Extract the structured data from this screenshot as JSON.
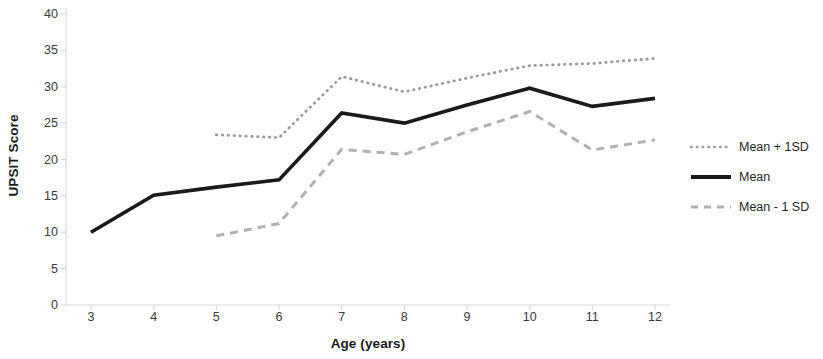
{
  "chart": {
    "type": "line",
    "ylabel": "UPSIT Score",
    "xlabel": "Age (years)"
  },
  "chart_data": {
    "type": "line",
    "title": "",
    "subtitle": "",
    "xlabel": "Age (years)",
    "ylabel": "UPSIT Score",
    "x": [
      3,
      4,
      5,
      6,
      7,
      8,
      9,
      10,
      11,
      12
    ],
    "xtick_labels": [
      "3",
      "4",
      "5",
      "6",
      "7",
      "8",
      "9",
      "10",
      "11",
      "12"
    ],
    "ytick_labels": [
      "0",
      "5",
      "10",
      "15",
      "20",
      "25",
      "30",
      "35",
      "40"
    ],
    "ytick_values": [
      0,
      5,
      10,
      15,
      20,
      25,
      30,
      35,
      40
    ],
    "xlim": [
      3,
      12
    ],
    "ylim": [
      0,
      40
    ],
    "grid": false,
    "legend_position": "right",
    "series": [
      {
        "name": "Mean + 1SD",
        "style": "dotted",
        "color": "#9a9a9a",
        "x": [
          5,
          6,
          7,
          8,
          9,
          10,
          11,
          12
        ],
        "values": [
          23.4,
          23.0,
          31.4,
          29.3,
          31.2,
          32.9,
          33.2,
          33.9
        ]
      },
      {
        "name": "Mean",
        "style": "solid",
        "color": "#1a1a1a",
        "x": [
          3,
          4,
          5,
          6,
          7,
          8,
          9,
          10,
          11,
          12
        ],
        "values": [
          10.0,
          15.1,
          16.2,
          17.2,
          26.4,
          25.0,
          27.5,
          29.8,
          27.3,
          28.4
        ]
      },
      {
        "name": "Mean - 1 SD",
        "style": "dashed",
        "color": "#b0b0b0",
        "x": [
          5,
          6,
          7,
          8,
          9,
          10,
          11,
          12
        ],
        "values": [
          9.5,
          11.2,
          21.4,
          20.7,
          23.8,
          26.6,
          21.3,
          22.7
        ]
      }
    ]
  },
  "legend": {
    "items": [
      {
        "label": "Mean + 1SD"
      },
      {
        "label": "Mean"
      },
      {
        "label": "Mean - 1 SD"
      }
    ]
  }
}
